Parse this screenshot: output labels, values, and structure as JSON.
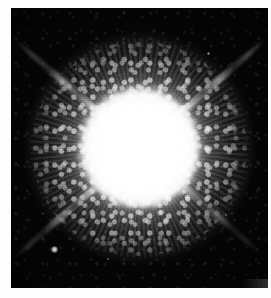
{
  "figure": {
    "kind": "astronomical-photograph",
    "background_color": "#050505",
    "border_color": "#fdfdfd",
    "highlight_color": "#ffffff"
  },
  "plate": {
    "left": 11,
    "top": 8,
    "width": 257,
    "height": 280
  },
  "objects": {
    "primary_star": {
      "name": "primary-star-core",
      "center_x_pct": 50,
      "center_y_pct": 50,
      "core_diameter_px": 118,
      "halo_diameter_px": 230
    },
    "companion_star": {
      "name": "companion-star",
      "x_px": 40,
      "y_px": 238,
      "diameter_px": 7
    },
    "diffraction_spikes": [
      {
        "name": "spike-upper-right",
        "angle_deg": -41,
        "length_px": 168,
        "brightness": "bright"
      },
      {
        "name": "spike-upper-left",
        "angle_deg": 221,
        "length_px": 168,
        "brightness": "bright"
      },
      {
        "name": "spike-lower-left",
        "angle_deg": 139,
        "length_px": 168,
        "brightness": "medium"
      },
      {
        "name": "spike-lower-right",
        "angle_deg": 41,
        "length_px": 160,
        "brightness": "faint"
      }
    ],
    "field_stars": [
      {
        "name": "field-star-1",
        "x_px": 196,
        "y_px": 44,
        "diameter_px": 3
      },
      {
        "name": "field-star-2",
        "x_px": 64,
        "y_px": 60,
        "diameter_px": 2
      },
      {
        "name": "field-star-3",
        "x_px": 214,
        "y_px": 206,
        "diameter_px": 2
      },
      {
        "name": "field-star-4",
        "x_px": 96,
        "y_px": 250,
        "diameter_px": 2
      }
    ]
  }
}
